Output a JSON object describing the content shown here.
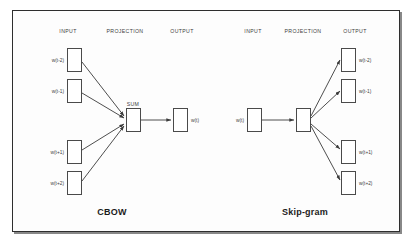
{
  "figure": {
    "background": "#ffffff",
    "frame_border_color": "#2e2e2e",
    "node_border_color": "#4a4a4a",
    "arrow_color": "#3a3a3a",
    "text_color": "#3d3d3d",
    "title_color": "#1b1b1b"
  },
  "panels": [
    {
      "id": "cbow",
      "title": "CBOW",
      "title_x": 112,
      "title_y": 207,
      "columns": [
        {
          "label": "INPUT",
          "x": 68
        },
        {
          "label": "PROJECTION",
          "x": 125
        },
        {
          "label": "OUTPUT",
          "x": 182
        },
        {
          "label": "INPUT",
          "x": 253
        },
        {
          "label": "PROJECTION",
          "x": 303
        },
        {
          "label": "OUTPUT",
          "x": 355
        }
      ],
      "sum_label": {
        "text": "SUM",
        "x": 133,
        "y": 101
      },
      "nodes": [
        {
          "name": "cbow-input-w-t-minus-2",
          "label": "w(t-2)",
          "label_side": "left",
          "x": 67,
          "y": 48,
          "w": 15,
          "h": 24
        },
        {
          "name": "cbow-input-w-t-minus-1",
          "label": "w(t-1)",
          "label_side": "left",
          "x": 67,
          "y": 79,
          "w": 15,
          "h": 24
        },
        {
          "name": "cbow-input-w-t-plus-1",
          "label": "w(t+1)",
          "label_side": "left",
          "x": 67,
          "y": 140,
          "w": 15,
          "h": 24
        },
        {
          "name": "cbow-input-w-t-plus-2",
          "label": "w(t+2)",
          "label_side": "left",
          "x": 67,
          "y": 171,
          "w": 15,
          "h": 24
        },
        {
          "name": "cbow-projection-sum",
          "label": "",
          "label_side": "none",
          "x": 126,
          "y": 108,
          "w": 15,
          "h": 24
        },
        {
          "name": "cbow-output-w-t",
          "label": "w(t)",
          "label_side": "right",
          "x": 173,
          "y": 108,
          "w": 15,
          "h": 24
        }
      ]
    },
    {
      "id": "skipgram",
      "title": "Skip-gram",
      "title_x": 305,
      "title_y": 207,
      "sum_label": null,
      "nodes": [
        {
          "name": "skipgram-input-w-t",
          "label": "w(t)",
          "label_side": "left",
          "x": 247,
          "y": 108,
          "w": 15,
          "h": 24
        },
        {
          "name": "skipgram-projection",
          "label": "",
          "label_side": "none",
          "x": 296,
          "y": 108,
          "w": 15,
          "h": 24
        },
        {
          "name": "skipgram-output-w-t-minus-2",
          "label": "w(t-2)",
          "label_side": "right",
          "x": 341,
          "y": 48,
          "w": 15,
          "h": 24
        },
        {
          "name": "skipgram-output-w-t-minus-1",
          "label": "w(t-1)",
          "label_side": "right",
          "x": 341,
          "y": 79,
          "w": 15,
          "h": 24
        },
        {
          "name": "skipgram-output-w-t-plus-1",
          "label": "w(t+1)",
          "label_side": "right",
          "x": 341,
          "y": 140,
          "w": 15,
          "h": 24
        },
        {
          "name": "skipgram-output-w-t-plus-2",
          "label": "w(t+2)",
          "label_side": "right",
          "x": 341,
          "y": 171,
          "w": 15,
          "h": 24
        }
      ]
    }
  ],
  "arrows": [
    {
      "name": "arrow-cbow-in-t-minus-2-to-sum",
      "x1": 82,
      "y1": 62,
      "x2": 124,
      "y2": 116
    },
    {
      "name": "arrow-cbow-in-t-minus-1-to-sum",
      "x1": 82,
      "y1": 93,
      "x2": 124,
      "y2": 118
    },
    {
      "name": "arrow-cbow-in-t-plus-1-to-sum",
      "x1": 82,
      "y1": 150,
      "x2": 124,
      "y2": 124
    },
    {
      "name": "arrow-cbow-in-t-plus-2-to-sum",
      "x1": 82,
      "y1": 181,
      "x2": 124,
      "y2": 126
    },
    {
      "name": "arrow-cbow-sum-to-output",
      "x1": 141,
      "y1": 120,
      "x2": 171,
      "y2": 120
    },
    {
      "name": "arrow-skipgram-in-to-projection",
      "x1": 262,
      "y1": 120,
      "x2": 294,
      "y2": 120
    },
    {
      "name": "arrow-skipgram-proj-to-t-minus-2",
      "x1": 311,
      "y1": 116,
      "x2": 340,
      "y2": 60
    },
    {
      "name": "arrow-skipgram-proj-to-t-minus-1",
      "x1": 311,
      "y1": 118,
      "x2": 340,
      "y2": 91
    },
    {
      "name": "arrow-skipgram-proj-to-t-plus-1",
      "x1": 311,
      "y1": 124,
      "x2": 340,
      "y2": 149
    },
    {
      "name": "arrow-skipgram-proj-to-t-plus-2",
      "x1": 311,
      "y1": 126,
      "x2": 340,
      "y2": 180
    }
  ],
  "column_headers_y": 28
}
